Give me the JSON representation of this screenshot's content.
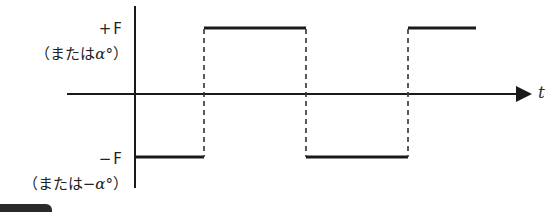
{
  "diagram": {
    "type": "square-wave",
    "labels": {
      "top_value": "+F",
      "top_note": "（または",
      "top_note_symbol": "α°",
      "top_note_close": "）",
      "bottom_value": "−F",
      "bottom_note": "（または−",
      "bottom_note_symbol": "α°",
      "bottom_note_close": "）",
      "time_axis": "t"
    },
    "levels": {
      "high": "+F",
      "low": "−F"
    },
    "segments": [
      {
        "level": "low",
        "from": 0,
        "to": 1
      },
      {
        "level": "high",
        "from": 1,
        "to": 2
      },
      {
        "level": "low",
        "from": 2,
        "to": 3
      },
      {
        "level": "high",
        "from": 3,
        "to": 3.65
      }
    ],
    "transitions_dashed": true,
    "colors": {
      "line": "#1a1a1a",
      "text": "#222222"
    }
  }
}
